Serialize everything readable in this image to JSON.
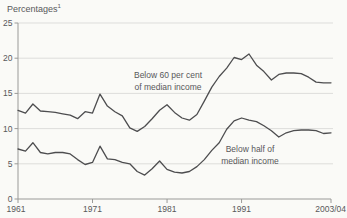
{
  "title": {
    "text": "Percentages",
    "footnote_marker": "1"
  },
  "colors": {
    "background": "#fafaf7",
    "line": "#4d4d4f",
    "grid": "#dddddb",
    "axis": "#9a9a98",
    "text": "#58585a"
  },
  "chart_data": {
    "type": "line",
    "x_start_year": 1961,
    "x_note": "annual points 1961 to 2003/04",
    "x_tick_labels": [
      "1961",
      "1971",
      "1981",
      "1991",
      "2003/04"
    ],
    "x_tick_indices": [
      0,
      10,
      20,
      30,
      42
    ],
    "ylim": [
      0,
      25
    ],
    "y_ticks": [
      0,
      5,
      10,
      15,
      20,
      25
    ],
    "grid": "horizontal",
    "legend_position": "inline-annotations",
    "series": [
      {
        "name": "Below 60 per cent of median income",
        "values": [
          12.6,
          12.2,
          13.5,
          12.5,
          12.4,
          12.3,
          12.1,
          11.9,
          11.4,
          12.4,
          12.2,
          14.9,
          13.2,
          12.4,
          11.8,
          10.1,
          9.6,
          10.3,
          11.4,
          12.6,
          13.4,
          12.3,
          11.5,
          11.2,
          12.0,
          13.9,
          15.9,
          17.4,
          18.6,
          20.1,
          19.8,
          20.6,
          19.0,
          18.1,
          16.9,
          17.7,
          17.9,
          17.9,
          17.8,
          17.3,
          16.6,
          16.5,
          16.5
        ]
      },
      {
        "name": "Below half of median income",
        "values": [
          7.1,
          6.8,
          8.0,
          6.6,
          6.4,
          6.6,
          6.6,
          6.4,
          5.6,
          4.9,
          5.2,
          7.5,
          5.7,
          5.6,
          5.2,
          5.0,
          3.9,
          3.4,
          4.3,
          5.4,
          4.2,
          3.8,
          3.7,
          3.9,
          4.6,
          5.6,
          6.9,
          8.0,
          9.9,
          11.1,
          11.5,
          11.2,
          11.0,
          10.4,
          9.7,
          8.8,
          9.4,
          9.7,
          9.8,
          9.8,
          9.7,
          9.3,
          9.4
        ]
      }
    ],
    "annotations": [
      {
        "lines": [
          "Below 60 per cent",
          "of median income"
        ]
      },
      {
        "lines": [
          "Below half of",
          "median income"
        ]
      }
    ]
  }
}
